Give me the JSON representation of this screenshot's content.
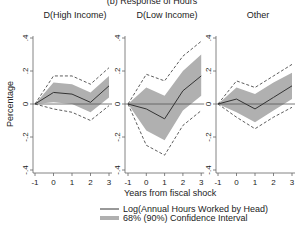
{
  "figure": {
    "title": "(b) Response of Hours",
    "ylabel": "Percentage",
    "xlabel": "Years from fiscal shock",
    "legend": [
      {
        "label": "Log(Annual Hours Worked by Head)",
        "type": "line",
        "color": "#333333"
      },
      {
        "label": "68% (90%) Confidence Interval",
        "type": "band",
        "color": "#b0b0b0"
      }
    ]
  },
  "chart_data": [
    {
      "type": "line",
      "title": "D(High Income)",
      "x": [
        -1,
        0,
        1,
        2,
        3
      ],
      "xlabel": "Years from fiscal shock",
      "ylabel": "Percentage",
      "ylim": [
        -0.4,
        0.4
      ],
      "yticks": [
        ".4",
        ".2",
        "0",
        "-.2",
        "-.4"
      ],
      "xticks": [
        "-1",
        "0",
        "1",
        "2",
        "3"
      ],
      "series": [
        {
          "name": "Log(Annual Hours Worked by Head)",
          "values": [
            0,
            0.07,
            0.06,
            0.01,
            0.11
          ]
        },
        {
          "name": "68% CI upper",
          "values": [
            0,
            0.13,
            0.12,
            0.07,
            0.17
          ]
        },
        {
          "name": "68% CI lower",
          "values": [
            0,
            0.01,
            0.0,
            -0.05,
            0.04
          ]
        },
        {
          "name": "90% CI upper",
          "values": [
            0,
            0.17,
            0.17,
            0.12,
            0.22
          ]
        },
        {
          "name": "90% CI lower",
          "values": [
            0,
            -0.03,
            -0.05,
            -0.1,
            -0.01
          ]
        }
      ]
    },
    {
      "type": "line",
      "title": "D(Low Income)",
      "x": [
        -1,
        0,
        1,
        2,
        3
      ],
      "xlabel": "Years from fiscal shock",
      "ylabel": "",
      "ylim": [
        -0.4,
        0.4
      ],
      "yticks": [
        ".4",
        ".2",
        "0",
        "-.2",
        "-.4"
      ],
      "xticks": [
        "-1",
        "0",
        "1",
        "2",
        "3"
      ],
      "series": [
        {
          "name": "Log(Annual Hours Worked by Head)",
          "values": [
            0,
            -0.03,
            -0.09,
            0.08,
            0.17
          ]
        },
        {
          "name": "68% CI upper",
          "values": [
            0,
            0.1,
            0.05,
            0.2,
            0.3
          ]
        },
        {
          "name": "68% CI lower",
          "values": [
            0,
            -0.16,
            -0.22,
            -0.04,
            0.05
          ]
        },
        {
          "name": "90% CI upper",
          "values": [
            0,
            0.18,
            0.14,
            0.29,
            0.38
          ]
        },
        {
          "name": "90% CI lower",
          "values": [
            0,
            -0.25,
            -0.31,
            -0.13,
            -0.04
          ]
        }
      ]
    },
    {
      "type": "line",
      "title": "Other",
      "x": [
        -1,
        0,
        1,
        2,
        3
      ],
      "xlabel": "Years from fiscal shock",
      "ylabel": "",
      "ylim": [
        -0.4,
        0.4
      ],
      "yticks": [
        ".4",
        ".2",
        "0",
        "-.2",
        "-.4"
      ],
      "xticks": [
        "-1",
        "0",
        "1",
        "2",
        "3"
      ],
      "series": [
        {
          "name": "Log(Annual Hours Worked by Head)",
          "values": [
            0,
            0.03,
            -0.03,
            0.04,
            0.11
          ]
        },
        {
          "name": "68% CI upper",
          "values": [
            0,
            0.1,
            0.06,
            0.13,
            0.19
          ]
        },
        {
          "name": "68% CI lower",
          "values": [
            0,
            -0.05,
            -0.11,
            -0.04,
            0.03
          ]
        },
        {
          "name": "90% CI upper",
          "values": [
            0,
            0.14,
            0.1,
            0.17,
            0.24
          ]
        },
        {
          "name": "90% CI lower",
          "values": [
            0,
            -0.08,
            -0.15,
            -0.08,
            -0.02
          ]
        }
      ]
    }
  ]
}
